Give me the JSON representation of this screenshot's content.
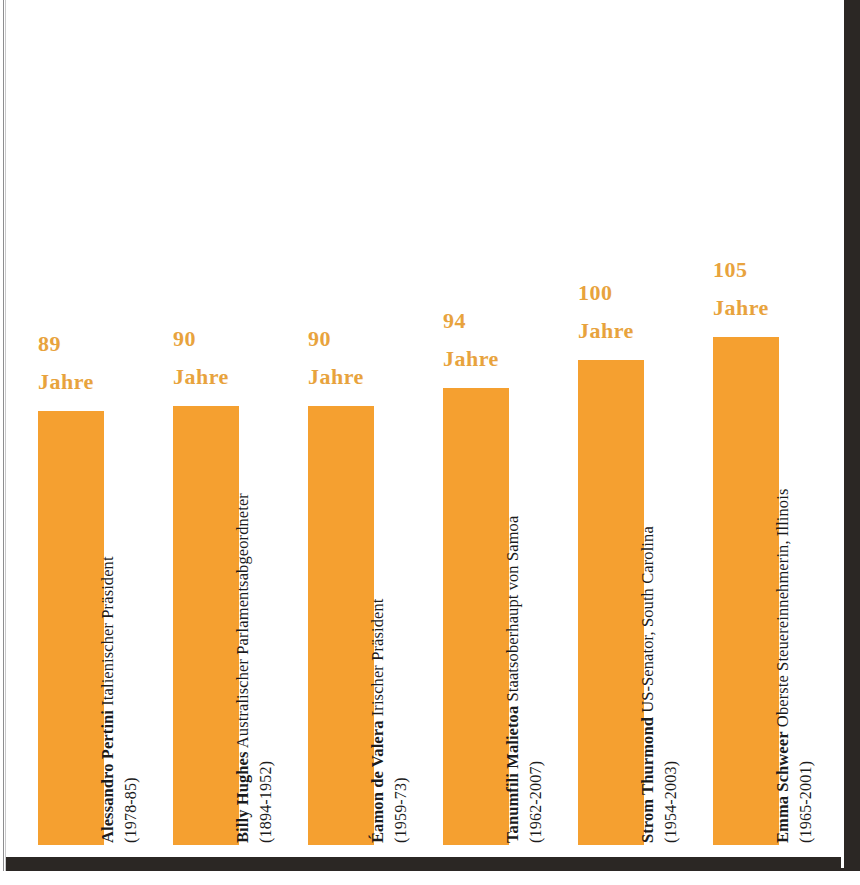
{
  "chart_data": {
    "type": "bar",
    "title": "",
    "subtitle": "",
    "xlabel": "",
    "ylabel": "",
    "unit": "Jahre",
    "ylim": [
      0,
      115
    ],
    "grid": false,
    "legend": null,
    "bar_color": "#F5A030",
    "value_label_color": "#E8A33D",
    "label_color": "#1b1b1b",
    "categories": [
      "Alessandro Pertini",
      "Billy Hughes",
      "Éamon de Valera",
      "Tanumfili Malietoa",
      "Strom Thurmond",
      "Emma Schweer"
    ],
    "values": [
      89,
      90,
      90,
      94,
      100,
      105
    ],
    "value_labels": [
      "89",
      "90",
      "90",
      "94",
      "100",
      "105"
    ],
    "points": [
      {
        "person": "Alessandro Pertini",
        "role": "Italienischer Präsident",
        "dates": "(1978-85)",
        "value": 89,
        "value_text": "89",
        "unit": "Jahre"
      },
      {
        "person": "Billy Hughes",
        "role": "Australischer Parlamentsabgeordneter",
        "dates": "(1894-1952)",
        "value": 90,
        "value_text": "90",
        "unit": "Jahre"
      },
      {
        "person": "Éamon de Valera",
        "role": "Irischer Präsident",
        "dates": "(1959-73)",
        "value": 90,
        "value_text": "90",
        "unit": "Jahre"
      },
      {
        "person": "Tanumfili Malietoa",
        "role": "Staatsoberhaupt von Samoa",
        "dates": "(1962-2007)",
        "value": 94,
        "value_text": "94",
        "unit": "Jahre"
      },
      {
        "person": "Strom Thurmond",
        "role": "US-Senator, South Carolina",
        "dates": "(1954-2003)",
        "value": 100,
        "value_text": "100",
        "unit": "Jahre"
      },
      {
        "person": "Emma Schweer",
        "role": "Oberste Steuereinnehmerin, Illinois",
        "dates": "(1965-2001)",
        "value": 105,
        "value_text": "105",
        "unit": "Jahre"
      }
    ]
  }
}
